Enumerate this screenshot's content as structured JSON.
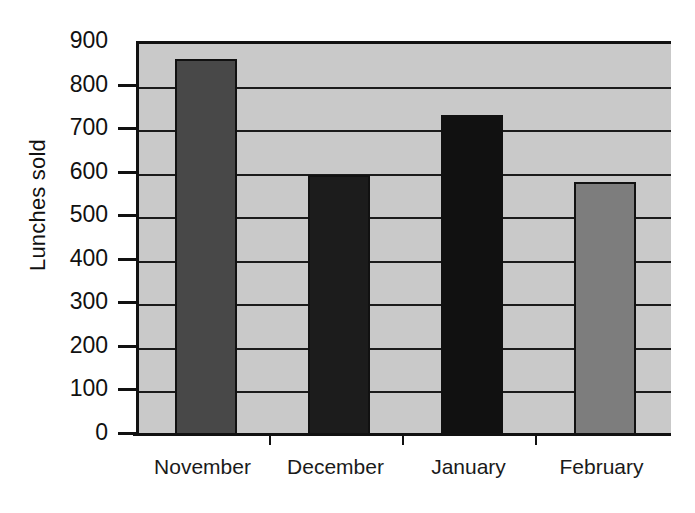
{
  "chart_data": {
    "type": "bar",
    "title": "",
    "xlabel": "",
    "ylabel": "Lunches sold",
    "categories": [
      "November",
      "December",
      "January",
      "February"
    ],
    "values": [
      865,
      600,
      737,
      583
    ],
    "series": [
      {
        "name": "Lunches sold",
        "values": [
          865,
          600,
          737,
          583
        ]
      }
    ],
    "ylim": [
      0,
      900
    ],
    "yticks": [
      0,
      100,
      200,
      300,
      400,
      500,
      600,
      700,
      800,
      900
    ],
    "ytick_labels": [
      "0",
      "100",
      "200",
      "300",
      "400",
      "500",
      "600",
      "700",
      "800",
      "900"
    ],
    "grid": true,
    "legend": "none",
    "bar_colors": [
      "#484848",
      "#1c1c1c",
      "#111111",
      "#7d7d7d"
    ],
    "plot_background": "#c9c9c9",
    "axis_color": "#111111",
    "page_background": "#ffffff"
  }
}
